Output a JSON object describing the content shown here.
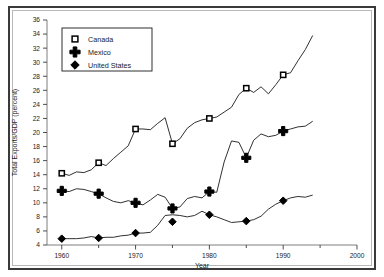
{
  "chart_data": {
    "type": "line",
    "title": "",
    "xlabel": "Year",
    "ylabel": "Total Exports/GDP (percent)",
    "xlim": [
      1958,
      2000
    ],
    "ylim": [
      4,
      36
    ],
    "ytick_step": 2,
    "xtick_major_step": 10,
    "xtick_minor_step": 5,
    "grid": false,
    "legend_position": "upper-left-inside",
    "yticks": [
      4,
      6,
      8,
      10,
      12,
      14,
      16,
      18,
      20,
      22,
      24,
      26,
      28,
      30,
      32,
      34,
      36
    ],
    "ytick_labels": [
      "4",
      "6",
      "8",
      "10",
      "12",
      "14",
      "16",
      "18",
      "20",
      "22",
      "24",
      "26",
      "28",
      "30",
      "32",
      "34",
      "36"
    ],
    "xticks_major": [
      1960,
      1970,
      1980,
      1990,
      2000
    ],
    "xtick_labels": [
      "1960",
      "1970",
      "1980",
      "1990",
      "2000"
    ],
    "xticks_minor": [
      1965,
      1975,
      1985,
      1995
    ],
    "series": [
      {
        "name": "Canada",
        "marker": "open-square",
        "marker_years": [
          1960,
          1965,
          1970,
          1975,
          1980,
          1985,
          1990
        ],
        "marker_values": [
          14.2,
          15.7,
          20.5,
          18.4,
          22.0,
          26.3,
          28.2
        ],
        "x": [
          1960,
          1961,
          1962,
          1963,
          1964,
          1965,
          1966,
          1967,
          1968,
          1969,
          1970,
          1971,
          1972,
          1973,
          1974,
          1975,
          1976,
          1977,
          1978,
          1979,
          1980,
          1981,
          1982,
          1983,
          1984,
          1985,
          1986,
          1987,
          1988,
          1989,
          1990,
          1991,
          1992,
          1993,
          1994
        ],
        "values": [
          14.2,
          13.9,
          14.4,
          14.3,
          14.7,
          15.7,
          15.3,
          16.3,
          17.2,
          18.1,
          20.5,
          20.5,
          20.4,
          21.3,
          22.1,
          18.4,
          19.1,
          20.6,
          21.4,
          21.8,
          22.0,
          22.2,
          22.9,
          23.6,
          25.4,
          26.3,
          25.7,
          26.5,
          25.5,
          26.8,
          28.2,
          28.5,
          30.2,
          31.8,
          33.8
        ]
      },
      {
        "name": "Mexico",
        "marker": "plus",
        "marker_years": [
          1960,
          1965,
          1970,
          1975,
          1980,
          1985,
          1990
        ],
        "marker_values": [
          11.7,
          11.3,
          10.0,
          9.2,
          11.6,
          16.4,
          20.2
        ],
        "x": [
          1960,
          1961,
          1962,
          1963,
          1964,
          1965,
          1966,
          1967,
          1968,
          1969,
          1970,
          1971,
          1972,
          1973,
          1974,
          1975,
          1976,
          1977,
          1978,
          1979,
          1980,
          1981,
          1982,
          1983,
          1984,
          1985,
          1986,
          1987,
          1988,
          1989,
          1990,
          1991,
          1992,
          1993,
          1994
        ],
        "values": [
          11.7,
          11.6,
          12.0,
          11.9,
          11.6,
          11.3,
          10.7,
          10.2,
          10.0,
          10.3,
          10.0,
          9.7,
          10.4,
          11.2,
          10.8,
          9.2,
          9.4,
          10.6,
          10.9,
          10.7,
          11.6,
          11.5,
          15.8,
          18.8,
          18.6,
          16.4,
          18.9,
          19.8,
          19.4,
          19.6,
          20.2,
          20.5,
          20.8,
          20.9,
          21.6
        ]
      },
      {
        "name": "United States",
        "marker": "solid-diamond",
        "marker_years": [
          1960,
          1965,
          1970,
          1975,
          1980,
          1985,
          1990
        ],
        "marker_values": [
          4.9,
          5.0,
          5.7,
          7.3,
          8.3,
          7.4,
          10.3
        ],
        "x": [
          1960,
          1961,
          1962,
          1963,
          1964,
          1965,
          1966,
          1967,
          1968,
          1969,
          1970,
          1971,
          1972,
          1973,
          1974,
          1975,
          1976,
          1977,
          1978,
          1979,
          1980,
          1981,
          1982,
          1983,
          1984,
          1985,
          1986,
          1987,
          1988,
          1989,
          1990,
          1991,
          1992,
          1993,
          1994
        ],
        "values": [
          4.9,
          4.9,
          4.9,
          5.0,
          5.2,
          5.0,
          5.1,
          5.1,
          5.3,
          5.4,
          5.7,
          5.7,
          5.8,
          6.8,
          8.2,
          8.3,
          8.2,
          8.0,
          8.2,
          8.8,
          8.3,
          8.0,
          7.6,
          7.2,
          7.3,
          7.4,
          7.6,
          8.1,
          9.1,
          9.8,
          10.3,
          10.7,
          10.9,
          10.8,
          11.1
        ]
      }
    ]
  }
}
